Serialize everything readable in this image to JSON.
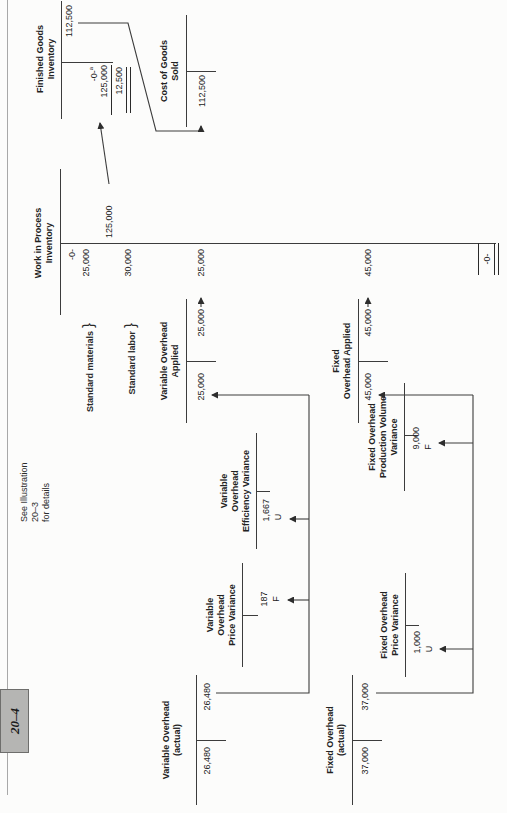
{
  "tab_label": "20–4",
  "note": {
    "line1": "See Illustration",
    "line2": "20–3",
    "line3": "for details"
  },
  "labels": {
    "materials": "Standard materials",
    "labor": "Standard labor",
    "brace": "}"
  },
  "accounts": {
    "variable_actual": {
      "title1": "Variable Overhead",
      "title2": "(actual)",
      "debit": "26,480",
      "credit": "26,480"
    },
    "variable_price_variance": {
      "title1": "Variable",
      "title2": "Overhead",
      "title3": "Price Variance",
      "amount": "187",
      "flag": "F"
    },
    "variable_efficiency_variance": {
      "title1": "Variable",
      "title2": "Overhead",
      "title3": "Efficiency Variance",
      "amount": "1,667",
      "flag": "U"
    },
    "variable_applied": {
      "title1": "Variable Overhead",
      "title2": "Applied",
      "debit": "25,000",
      "credit": "25,000"
    },
    "fixed_actual": {
      "title1": "Fixed Overhead",
      "title2": "(actual)",
      "debit": "37,000",
      "credit": "37,000"
    },
    "fixed_price_variance": {
      "title1": "Fixed Overhead",
      "title2": "Price Variance",
      "amount": "1,000",
      "flag": "U"
    },
    "fixed_volume_variance": {
      "title1": "Fixed Overhead",
      "title2": "Production Volume",
      "title3": "Variance",
      "amount": "9,000",
      "flag": "F"
    },
    "fixed_applied": {
      "title1": "Fixed",
      "title2": "Overhead Applied",
      "debit": "45,000",
      "credit": "45,000"
    },
    "wip": {
      "title1": "Work in Process",
      "title2": "Inventory",
      "debits": [
        "-0-",
        "25,000",
        "30,000",
        "25,000",
        "45,000"
      ],
      "credit": "125,000",
      "ending_balance": "-0-"
    },
    "fg": {
      "title1": "Finished Goods",
      "title2": "Inventory",
      "debit_begin": "-0-",
      "debit_begin_note": "a",
      "debit_in": "125,000",
      "ending_balance": "12,500",
      "credit": "112,500"
    },
    "cogs": {
      "title1": "Cost of Goods",
      "title2": "Sold",
      "debit": "112,500"
    }
  }
}
